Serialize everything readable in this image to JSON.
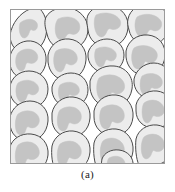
{
  "figure": {
    "caption": "(a)",
    "panel_label": "(a)",
    "kind": "microstructure-schematic"
  },
  "colors": {
    "background": "#ffffff",
    "frame_stroke": "#9a9a9a",
    "grain_fill": "#ececec",
    "grain_stroke": "#4a4a4a",
    "inclusion_fill": "#c4c4c4",
    "inclusion_stroke": "#c4c4c4",
    "caption_text": "#1a1a1a"
  },
  "panel": {
    "x": 10,
    "y": 9,
    "width": 155,
    "height": 155,
    "stroke_width": 1
  },
  "chart_data": {
    "type": "diagram",
    "title": "(a)",
    "xlabel": "",
    "ylabel": "",
    "viewbox": [
      0,
      0,
      155,
      155
    ],
    "grain_count": 21,
    "legend": [
      {
        "name": "grain (matrix phase)",
        "color": "#ececec"
      },
      {
        "name": "second-phase inclusion",
        "color": "#c4c4c4"
      },
      {
        "name": "grain boundary",
        "color": "#4a4a4a"
      }
    ],
    "grains": [
      {
        "id": "grain-01",
        "outline": "M 0,26 C 2,14 10,4 20,0 L 30,0 C 36,6 38,16 36,26 C 34,36 26,44 16,44 C 6,44 0,36 0,26 Z",
        "inclusion": "M 10,14 C 16,9 24,9 27,14 C 29,19 25,23 22,21 C 19,19 20,27 15,29 C 10,30 8,20 10,14 Z"
      },
      {
        "id": "grain-02",
        "outline": "M 36,8 C 40,1 50,-3 60,-1 C 70,1 78,10 78,20 C 78,31 70,40 59,41 C 48,42 39,35 37,25 C 35,18 34,13 36,8 Z",
        "inclusion": "M 48,10 C 56,6 66,8 69,14 C 72,21 67,27 61,25 C 56,23 57,30 51,31 C 45,31 43,16 48,10 Z"
      },
      {
        "id": "grain-03",
        "outline": "M 78,6 C 82,-2 92,-5 102,-3 C 112,-1 119,8 118,19 C 117,30 109,38 98,38 C 87,38 79,31 78,21 C 77,15 76,11 78,6 Z",
        "inclusion": "M 86,6 C 94,2 106,4 110,11 C 113,18 106,22 101,20 C 96,18 98,26 92,28 C 85,29 82,12 86,6 Z"
      },
      {
        "id": "grain-04",
        "outline": "M 118,10 C 120,0 130,-6 141,-5 C 152,-4 159,4 159,15 C 159,26 152,35 141,36 C 130,37 121,31 119,21 C 118,17 117,14 118,10 Z",
        "inclusion": "M 127,8 C 135,3 147,5 151,12 C 154,19 147,24 142,21 C 137,19 139,27 132,28 C 125,28 123,14 127,8 Z"
      },
      {
        "id": "grain-05",
        "outline": "M 0,48 C 1,40 8,33 17,32 C 27,31 35,38 36,48 C 37,59 31,68 21,70 C 11,72 2,66 0,56 Z",
        "inclusion": "M 8,44 C 14,38 24,39 27,45 C 30,51 24,56 19,54 C 14,52 17,62 11,62 C 5,61 4,49 8,44 Z"
      },
      {
        "id": "grain-06",
        "outline": "M 38,46 C 40,36 49,29 59,30 C 70,31 77,40 76,51 C 75,63 67,71 56,71 C 46,71 39,63 38,53 Z",
        "inclusion": "M 46,42 C 54,37 65,40 67,47 C 69,54 62,58 58,55 C 54,52 56,62 50,63 C 43,63 42,47 46,42 Z"
      },
      {
        "id": "grain-07",
        "outline": "M 78,44 C 80,36 88,30 97,30 C 107,30 114,37 114,46 C 114,56 107,63 97,64 C 87,64 79,57 78,48 Z",
        "inclusion": "M 86,40 C 93,36 103,38 106,44 C 108,50 102,54 98,51 C 94,49 96,57 91,58 C 85,58 83,45 86,40 Z"
      },
      {
        "id": "grain-08",
        "outline": "M 116,42 C 118,32 127,25 138,26 C 149,27 156,36 155,47 C 154,59 146,66 135,66 C 124,66 117,58 116,48 Z",
        "inclusion": "M 124,39 C 132,34 144,37 147,44 C 149,51 142,56 137,53 C 133,50 135,60 128,60 C 121,60 120,44 124,39 Z"
      },
      {
        "id": "grain-09",
        "outline": "M 0,78 C 1,69 9,62 19,62 C 30,62 38,70 38,80 C 38,91 30,99 19,99 C 8,99 1,92 0,83 Z",
        "inclusion": "M 8,74 C 15,69 25,71 28,77 C 31,83 24,88 20,85 C 16,83 18,92 12,93 C 6,93 4,79 8,74 Z"
      },
      {
        "id": "grain-10",
        "outline": "M 42,78 C 44,70 52,64 61,64 C 71,64 78,71 78,81 C 78,91 70,98 60,98 C 50,98 43,91 42,82 Z",
        "inclusion": "M 50,76 C 57,71 67,73 69,79 C 71,85 65,88 61,86 C 57,84 59,92 54,93 C 48,93 47,80 50,76 Z"
      },
      {
        "id": "grain-11",
        "outline": "M 80,72 C 83,62 93,56 104,57 C 116,58 124,68 122,80 C 120,92 111,99 99,98 C 88,97 81,89 80,79 Z",
        "inclusion": "M 89,69 C 98,63 111,66 114,74 C 117,82 109,87 104,84 C 99,81 101,92 94,92 C 86,92 85,75 89,69 Z"
      },
      {
        "id": "grain-12",
        "outline": "M 124,70 C 126,61 134,54 144,54 C 154,54 161,62 161,72 C 161,83 153,90 143,90 C 132,90 125,83 124,74 Z",
        "inclusion": "M 132,67 C 140,62 150,65 152,71 C 154,78 147,81 143,79 C 139,77 141,86 136,86 C 129,86 129,72 132,67 Z"
      },
      {
        "id": "grain-13",
        "outline": "M 0,108 C 2,99 10,92 20,92 C 31,92 39,101 38,112 C 37,124 29,132 18,132 C 7,132 0,124 0,114 Z",
        "inclusion": "M 8,105 C 16,99 27,102 29,109 C 31,116 24,121 19,118 C 15,116 17,126 11,126 C 4,126 4,110 8,105 Z"
      },
      {
        "id": "grain-14",
        "outline": "M 42,104 C 44,94 53,87 63,88 C 74,89 81,98 80,109 C 79,121 71,128 60,128 C 49,128 42,120 42,110 Z",
        "inclusion": "M 50,101 C 58,95 69,98 71,105 C 73,113 66,117 61,114 C 57,112 59,122 53,122 C 46,122 46,106 50,101 Z"
      },
      {
        "id": "grain-15",
        "outline": "M 84,102 C 86,92 95,85 106,86 C 117,87 124,97 123,108 C 122,120 113,127 102,127 C 91,126 84,118 84,108 Z",
        "inclusion": "M 92,99 C 101,93 112,96 114,104 C 116,112 109,116 104,113 C 100,110 102,120 96,120 C 89,120 88,104 92,99 Z"
      },
      {
        "id": "grain-16",
        "outline": "M 126,96 C 128,87 137,81 147,82 C 157,83 164,92 163,102 C 162,113 154,120 144,119 C 133,119 126,111 126,102 Z",
        "inclusion": "M 134,94 C 142,88 152,92 154,99 C 156,106 149,109 145,107 C 141,105 143,113 137,114 C 131,113 131,98 134,94 Z"
      },
      {
        "id": "grain-17",
        "outline": "M 0,138 C 2,130 11,124 21,125 C 32,126 39,135 38,146 C 37,156 30,163 20,164 L 2,164 C 0,158 -1,146 0,138 Z",
        "inclusion": "M 8,136 C 16,130 27,133 29,141 C 31,148 24,152 19,150 C 15,148 17,158 10,158 C 4,157 4,141 8,136 Z"
      },
      {
        "id": "grain-18",
        "outline": "M 42,137 C 44,128 53,121 63,122 C 74,123 81,132 80,143 C 79,154 72,161 62,162 L 46,162 C 42,156 41,145 42,137 Z",
        "inclusion": "M 50,135 C 59,129 69,133 71,140 C 73,148 66,152 61,149 C 57,146 59,156 52,157 C 46,156 46,140 50,135 Z"
      },
      {
        "id": "grain-19",
        "outline": "M 84,134 C 86,125 96,119 106,120 C 117,121 124,131 123,142 C 122,153 114,160 104,161 L 88,161 C 84,155 83,142 84,134 Z",
        "inclusion": "M 93,132 C 101,126 112,130 114,138 C 116,145 109,149 104,146 C 100,144 102,154 95,154 C 89,153 89,137 93,132 Z"
      },
      {
        "id": "grain-20",
        "outline": "M 126,130 C 128,121 137,115 147,116 C 157,117 164,126 163,137 C 162,148 155,155 145,156 L 129,156 C 126,150 125,138 126,130 Z",
        "inclusion": "M 134,128 C 142,122 152,126 154,133 C 156,141 149,144 145,142 C 141,139 143,149 136,150 C 130,149 130,133 134,128 Z"
      },
      {
        "id": "grain-21",
        "outline": "M 92,150 C 94,144 101,140 109,141 C 118,142 124,149 123,157 L 122,166 L 94,166 C 91,161 91,155 92,150 Z",
        "inclusion": "M 99,149 C 106,145 114,148 115,154 C 117,160 111,163 107,161 C 104,159 105,166 100,166 C 96,165 96,152 99,149 Z"
      }
    ]
  }
}
